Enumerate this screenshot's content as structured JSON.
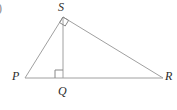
{
  "figure": {
    "kind": "geometry-diagram",
    "item_marker": ")",
    "background_color": "#ffffff",
    "stroke_color": "#a0a0a0",
    "label_color": "#2b2b2b",
    "stroke_width": 1,
    "vertices": [
      {
        "id": "S",
        "label": "S",
        "x": 63,
        "y": 17
      },
      {
        "id": "P",
        "label": "P",
        "x": 25,
        "y": 78
      },
      {
        "id": "Q",
        "label": "Q",
        "x": 63,
        "y": 78
      },
      {
        "id": "R",
        "label": "R",
        "x": 163,
        "y": 78
      }
    ],
    "segments": [
      {
        "id": "PS",
        "from": "P",
        "to": "S"
      },
      {
        "id": "SR",
        "from": "S",
        "to": "R"
      },
      {
        "id": "PR",
        "from": "P",
        "to": "R"
      },
      {
        "id": "SQ",
        "from": "S",
        "to": "Q"
      }
    ],
    "right_angles": [
      {
        "id": "angle-at-S",
        "at": "S",
        "between": "PS and SR",
        "size": 7
      },
      {
        "id": "angle-at-Q",
        "at": "Q",
        "between": "SQ and QP",
        "size": 8
      }
    ]
  }
}
